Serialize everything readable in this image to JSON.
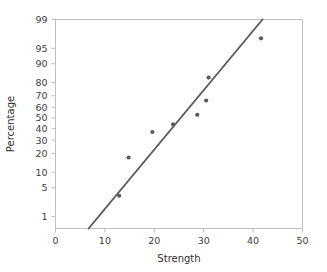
{
  "chart_data": {
    "type": "scatter",
    "title": "",
    "xlabel": "Strength",
    "ylabel": "Percentage",
    "xlim": [
      0,
      50
    ],
    "ylim": [
      0.4,
      99
    ],
    "yscale": "normal-probability",
    "grid": false,
    "legend": null,
    "xticks": [
      0,
      10,
      20,
      30,
      40,
      50
    ],
    "xtick_labels": [
      "0",
      "10",
      "20",
      "30",
      "40",
      "50"
    ],
    "yticks": [
      1,
      5,
      10,
      20,
      30,
      40,
      50,
      60,
      70,
      80,
      90,
      95,
      99
    ],
    "ytick_labels": [
      "1",
      "5",
      "10",
      "20",
      "30",
      "40",
      "50",
      "60",
      "70",
      "80",
      "90",
      "95",
      "99"
    ],
    "series": [
      {
        "name": "data-points",
        "marker": "circle",
        "color": "#5a5a5a",
        "x": [
          12.9,
          14.8,
          19.6,
          23.8,
          28.7,
          30.5,
          31.0,
          41.6
        ],
        "y": [
          3.3,
          17.5,
          37.0,
          44.0,
          53.0,
          66.0,
          83.0,
          97.0
        ]
      },
      {
        "name": "fit-line",
        "type": "line",
        "color": "#5a5a5a",
        "x": [
          6.7,
          41.9
        ],
        "y": [
          0.45,
          99.0
        ]
      }
    ]
  },
  "axes": {
    "x_title": "Strength",
    "y_title": "Percentage"
  },
  "colors": {
    "marker": "#5a5a5a",
    "line": "#5a5a5a",
    "axis": "#bfbfbf",
    "text": "#3d3d3d",
    "background": "#ffffff"
  }
}
